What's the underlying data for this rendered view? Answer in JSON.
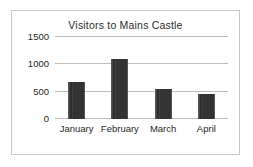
{
  "chart_data": {
    "type": "bar",
    "title": "Visitors to Mains Castle",
    "xlabel": "",
    "ylabel": "",
    "categories": [
      "January",
      "February",
      "March",
      "April"
    ],
    "values": [
      670,
      1090,
      550,
      460
    ],
    "yticks": [
      0,
      500,
      1000,
      1500
    ],
    "ytick_labels": [
      "0",
      "500",
      "1000",
      "1500"
    ],
    "ylim": [
      0,
      1500
    ],
    "grid": true,
    "legend": false,
    "legend_position": "none",
    "bar_color": "#3a3a3a",
    "gridline_color": "#bdbdbd",
    "border_color": "#c9c9c9",
    "background_color": "#ffffff"
  }
}
